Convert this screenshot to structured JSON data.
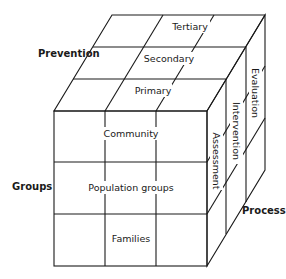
{
  "axes": {
    "prevention": "Prevention",
    "groups": "Groups",
    "process": "Process"
  },
  "prevention_levels": [
    "Primary",
    "Secondary",
    "Tertiary"
  ],
  "group_levels": [
    "Community",
    "Population groups",
    "Families"
  ],
  "process_levels": [
    "Assessment",
    "Intervention",
    "Evaluation"
  ],
  "colors": {
    "line": "#1a1a1a",
    "background": "#ffffff"
  }
}
